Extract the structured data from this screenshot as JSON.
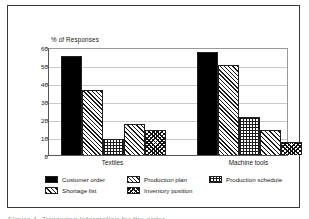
{
  "figure": {
    "caption": "Figure 1. Triggering information for the order"
  },
  "chart_data": {
    "type": "bar",
    "title": "",
    "subtitle": "",
    "axis_title": "% of Responses",
    "xlabel": "",
    "ylabel": "% of Responses",
    "ylim": [
      0,
      60
    ],
    "yticks": [
      0,
      10,
      20,
      30,
      40,
      50,
      60
    ],
    "grid": true,
    "legend_position": "bottom",
    "categories": [
      "Textiles",
      "Machine tools"
    ],
    "series": [
      {
        "name": "Customer order",
        "pattern": "solid",
        "values": [
          55,
          57
        ]
      },
      {
        "name": "Production plan",
        "pattern": "diag",
        "values": [
          36,
          50
        ]
      },
      {
        "name": "Production schedule",
        "pattern": "grid",
        "values": [
          9,
          21
        ]
      },
      {
        "name": "Shortage list",
        "pattern": "diag2",
        "values": [
          17,
          14
        ]
      },
      {
        "name": "Inventory position",
        "pattern": "cross",
        "values": [
          14,
          7
        ]
      }
    ]
  }
}
